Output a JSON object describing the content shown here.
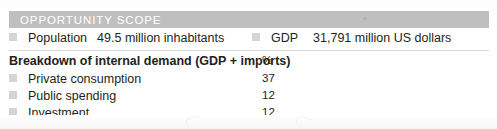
{
  "panel": {
    "title": "OPPORTUNITY SCOPE",
    "header_bg": "#bfbfbf",
    "header_text_color": "#ffffff",
    "bullet_color": "#d4d4d4",
    "divider_color": "#d9d9d9",
    "text_color": "#231f20"
  },
  "summary": {
    "population": {
      "bullet": "square-bullet-icon",
      "label": "Population",
      "value": "49.5 million inhabitants"
    },
    "gdp": {
      "bullet": "square-bullet-icon",
      "label": "GDP",
      "value": "31,791 million US dollars"
    }
  },
  "breakdown": {
    "heading": "Breakdown of internal demand (GDP + imports)",
    "unit_header": "%",
    "rows": [
      {
        "bullet": "square-bullet-icon",
        "label": "Private consumption",
        "value": "37"
      },
      {
        "bullet": "square-bullet-icon",
        "label": "Public spending",
        "value": "12"
      },
      {
        "bullet": "square-bullet-icon",
        "label": "Investment",
        "value": "12"
      }
    ]
  }
}
